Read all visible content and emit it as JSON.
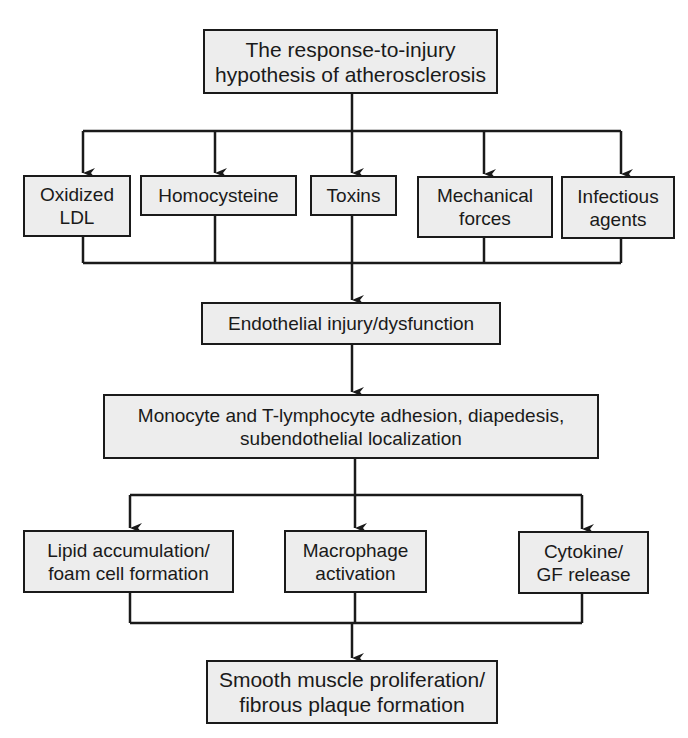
{
  "diagram": {
    "title_box": "The response-to-injury\nhypothesis of atherosclerosis",
    "causes": [
      "Oxidized\nLDL",
      "Homocysteine",
      "Toxins",
      "Mechanical\nforces",
      "Infectious\nagents"
    ],
    "step1": "Endothelial injury/dysfunction",
    "step2": "Monocyte and T-lymphocyte adhesion, diapedesis,\nsubendothelial localization",
    "effects": [
      "Lipid accumulation/\nfoam cell formation",
      "Macrophage\nactivation",
      "Cytokine/\nGF release"
    ],
    "outcome": "Smooth muscle proliferation/\nfibrous plaque formation",
    "colors": {
      "box_fill": "#ededed",
      "line": "#1a1a1a",
      "background": "#ffffff"
    }
  }
}
